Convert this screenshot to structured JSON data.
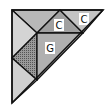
{
  "diagram": {
    "type": "tangram-triangle",
    "outline_color": "#111111",
    "pieces": [
      {
        "id": "top-left-triangle",
        "points": "12,10 60,10 37,33",
        "fill": "#b8b8b8",
        "label": ""
      },
      {
        "id": "left-triangle",
        "points": "12,10 37,33 12,58",
        "fill": "#d4d4d4",
        "label": ""
      },
      {
        "id": "small-triangle-c-left",
        "points": "60,10 83,33 37,33",
        "fill": "#a0a0a0",
        "label": "C"
      },
      {
        "id": "small-triangle-c-right",
        "points": "60,10 103,10 83,33",
        "fill": "#c4c4c4",
        "label": "C"
      },
      {
        "id": "parallelogram",
        "points": "37,33 12,58 37,80 37,80",
        "fill": "#8c8c8c",
        "label": "",
        "pattern": "dots"
      },
      {
        "id": "large-triangle-g",
        "points": "37,33 83,33 37,80",
        "fill": "#b0b0b0",
        "label": "G"
      },
      {
        "id": "bottom-triangle",
        "points": "12,58 37,80 12,103",
        "fill": "#d0d0d0",
        "label": ""
      }
    ],
    "labels": [
      {
        "text": "C",
        "x": 59,
        "y": 25
      },
      {
        "text": "C",
        "x": 84,
        "y": 19
      },
      {
        "text": "G",
        "x": 50,
        "y": 48
      }
    ]
  }
}
